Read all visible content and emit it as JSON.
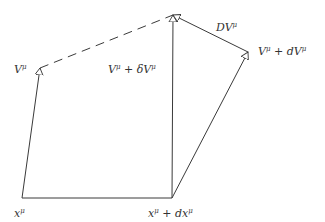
{
  "diagram": {
    "type": "vector-parallel-transport",
    "stroke_color": "#3a3a3a",
    "background": "#ffffff",
    "nodes": {
      "x": {
        "x": 22,
        "y": 198
      },
      "x_dx": {
        "x": 172,
        "y": 198
      },
      "v_tip": {
        "x": 40,
        "y": 68
      },
      "apex": {
        "x": 173,
        "y": 15
      },
      "v_dv_tip": {
        "x": 248,
        "y": 52
      }
    },
    "labels": {
      "x_mu": {
        "base": "x",
        "sup": "μ"
      },
      "x_dx": {
        "base": "x",
        "sup": "μ",
        "rest": " + dx",
        "sup2": "μ"
      },
      "v_mu": {
        "base": "V",
        "sup": "μ"
      },
      "v_delta": {
        "base": "V",
        "sup": "μ",
        "rest": " + δV",
        "sup2": "μ"
      },
      "v_d": {
        "base": "V",
        "sup": "μ",
        "rest": " + dV",
        "sup2": "μ"
      },
      "DV": {
        "base": "DV",
        "sup": "μ"
      }
    }
  }
}
